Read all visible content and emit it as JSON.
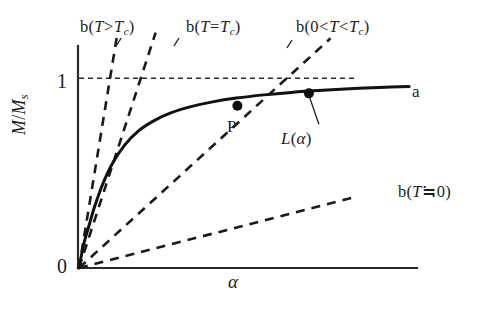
{
  "figure": {
    "background_color": "#ffffff",
    "ink_color": "#1a1a1a",
    "axis_x_label": "α",
    "axis_y_label_numerator": "M",
    "axis_y_label_denominator": "M",
    "axis_y_label_subscript": "s",
    "tick_one": "1",
    "tick_zero": "0"
  },
  "labels": {
    "b_above_tc": "b(T>T_c)",
    "b_at_tc": "b(T=T_c)",
    "b_between": "b(0<T<T_c)",
    "b_near_zero": "b(T≒0)",
    "point_p": "P",
    "langevin": "L(α)",
    "curve_a": "a",
    "b_symbol": "b",
    "T_symbol": "T",
    "c_subscript": "c",
    "paren_open": "(",
    "paren_close": ")",
    "op_gt": ">",
    "op_lt": "<",
    "op_eq": "=",
    "op_approx": "≒",
    "zero": "0",
    "alpha": "α",
    "L_symbol": "L",
    "slash": "/",
    "s_subscript": "s",
    "M_symbol": "M"
  },
  "chart_data": {
    "type": "line",
    "title": "",
    "xlabel": "α",
    "ylabel": "M/M_s",
    "xlim": [
      0,
      8.6
    ],
    "ylim": [
      0,
      1.18
    ],
    "grid": false,
    "legend": "none",
    "y_ticks": [
      0,
      1
    ],
    "y_tick_labels": [
      "0",
      "1"
    ],
    "x_ticks": [],
    "saturation_level": 1.0,
    "series": [
      {
        "name": "L(α)",
        "kind": "solid-curve",
        "label_at_end": "a",
        "description": "Langevin function L(alpha)=coth(alpha)-1/alpha, saturating toward M/Ms = 1",
        "x": [
          0,
          0.12,
          0.25,
          0.4,
          0.6,
          0.85,
          1.15,
          1.5,
          1.9,
          2.35,
          2.85,
          3.4,
          4.0,
          4.7,
          5.4,
          6.2,
          7.0,
          7.8,
          8.4
        ],
        "y": [
          0,
          0.125,
          0.22,
          0.325,
          0.44,
          0.55,
          0.645,
          0.72,
          0.775,
          0.818,
          0.85,
          0.875,
          0.895,
          0.912,
          0.925,
          0.936,
          0.945,
          0.952,
          0.956
        ]
      },
      {
        "name": "b(T>T_c)",
        "kind": "dashed-tangent",
        "slope_note": "steepest line through origin, lies above the Langevin initial slope",
        "x": [
          0,
          0.98
        ],
        "y": [
          0,
          1.24
        ]
      },
      {
        "name": "b(T=T_c)",
        "kind": "dashed-tangent",
        "slope_note": "tangent to Langevin curve at the origin",
        "x": [
          0,
          1.95
        ],
        "y": [
          0,
          1.24
        ]
      },
      {
        "name": "b(0<T<T_c)",
        "kind": "dashed-tangent",
        "slope_note": "intersects the Langevin curve at point P",
        "x": [
          0,
          6.4
        ],
        "y": [
          0,
          1.21
        ]
      },
      {
        "name": "b(T≒0)",
        "kind": "dashed-tangent",
        "slope_note": "shallow line, nearly along the alpha axis",
        "x": [
          0,
          6.95
        ],
        "y": [
          0,
          0.37
        ]
      },
      {
        "name": "saturation",
        "kind": "dashed-horizontal",
        "x": [
          0,
          7.1
        ],
        "y": [
          1.0,
          1.0
        ]
      }
    ],
    "annotations": [
      {
        "name": "P",
        "text": "P",
        "x": 4.03,
        "y": 0.855,
        "marker": true,
        "note": "intersection of Langevin curve with b(0<T<T_c)"
      },
      {
        "name": "L(α)",
        "text": "L(α)",
        "x": 5.85,
        "y": 0.92,
        "marker": true,
        "leader": true,
        "note": "label of the solid Langevin curve with leader line"
      },
      {
        "name": "a",
        "text": "a",
        "x": 8.7,
        "y": 0.955,
        "marker": false,
        "note": "end label of solid curve"
      }
    ]
  }
}
